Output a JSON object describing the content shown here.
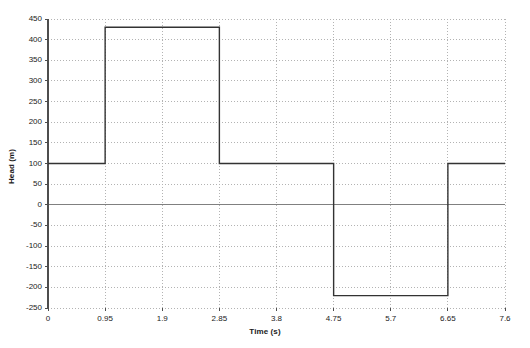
{
  "chart_data": {
    "type": "line",
    "title": "",
    "subtitle": "",
    "xlabel": "Time (s)",
    "ylabel": "Head (m)",
    "xlim": [
      0,
      7.6
    ],
    "ylim": [
      -250,
      450
    ],
    "xticks": [
      0,
      0.95,
      1.9,
      2.85,
      3.8,
      4.75,
      5.7,
      6.65,
      7.6
    ],
    "xtick_labels": [
      "0",
      "0.95",
      "1.9",
      "2.85",
      "3.8",
      "4.75",
      "5.7",
      "6.65",
      "7.6"
    ],
    "yticks": [
      -250,
      -200,
      -150,
      -100,
      -50,
      0,
      50,
      100,
      150,
      200,
      250,
      300,
      350,
      400,
      450
    ],
    "ytick_labels": [
      "-250",
      "-200",
      "-150",
      "-100",
      "-50",
      "0",
      "50",
      "100",
      "150",
      "200",
      "250",
      "300",
      "350",
      "400",
      "450"
    ],
    "grid": true,
    "grid_style": "dotted",
    "legend": "none",
    "zero_line": 0,
    "series": [
      {
        "name": "Head",
        "color": "#333333",
        "line_width": 1.4,
        "x": [
          0,
          0.95,
          0.95,
          2.85,
          2.85,
          4.75,
          4.75,
          6.65,
          6.65,
          7.6
        ],
        "y": [
          100,
          100,
          430,
          430,
          100,
          100,
          -220,
          -220,
          100,
          100
        ]
      }
    ],
    "annotations": []
  },
  "axes": {
    "plot_left_px": 48,
    "plot_right_px": 505,
    "plot_top_px": 19,
    "plot_bottom_px": 308,
    "frame_color": "#4d4d4d",
    "grid_color": "#b3b3b3",
    "zero_line_color": "#808080"
  }
}
